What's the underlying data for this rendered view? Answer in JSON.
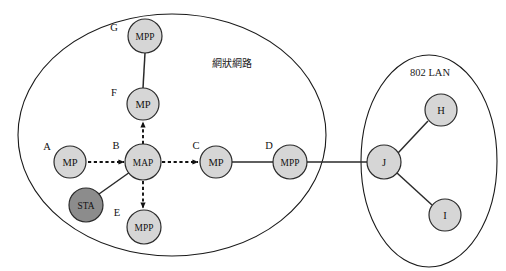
{
  "diagram": {
    "background_color": "#ffffff",
    "regions": [
      {
        "id": "mesh-network",
        "label": "網狀網路",
        "label_x": 232,
        "label_y": 63,
        "cx": 172,
        "cy": 135,
        "rx": 154,
        "ry": 121,
        "stroke": "#1a1a1a"
      },
      {
        "id": "lan-802",
        "label": "802 LAN",
        "label_x": 430,
        "label_y": 72,
        "cx": 429,
        "cy": 161,
        "rx": 68,
        "ry": 106,
        "stroke": "#1a1a1a"
      }
    ],
    "nodes": [
      {
        "id": "G",
        "tag": "G",
        "label": "MPP",
        "x": 145,
        "y": 36,
        "r": 17,
        "fill": "#d6d6d6",
        "tag_x": 114,
        "tag_y": 27,
        "size": "small"
      },
      {
        "id": "F",
        "tag": "F",
        "label": "MP",
        "x": 143,
        "y": 104,
        "r": 16,
        "fill": "#d6d6d6",
        "tag_x": 114,
        "tag_y": 92,
        "size": "normal"
      },
      {
        "id": "A",
        "tag": "A",
        "label": "MP",
        "x": 70,
        "y": 162,
        "r": 16,
        "fill": "#d6d6d6",
        "tag_x": 47,
        "tag_y": 146,
        "size": "normal"
      },
      {
        "id": "B",
        "tag": "B",
        "label": "MAP",
        "x": 143,
        "y": 162,
        "r": 18,
        "fill": "#d6d6d6",
        "tag_x": 116,
        "tag_y": 145,
        "size": "small"
      },
      {
        "id": "STA",
        "tag": "",
        "label": "STA",
        "x": 86,
        "y": 205,
        "r": 17,
        "fill": "#8c8c8c",
        "tag_x": 0,
        "tag_y": 0,
        "size": "small"
      },
      {
        "id": "E",
        "tag": "E",
        "label": "MPP",
        "x": 144,
        "y": 227,
        "r": 17,
        "fill": "#d6d6d6",
        "tag_x": 117,
        "tag_y": 212,
        "size": "small"
      },
      {
        "id": "C",
        "tag": "C",
        "label": "MP",
        "x": 216,
        "y": 162,
        "r": 16,
        "fill": "#d6d6d6",
        "tag_x": 196,
        "tag_y": 145,
        "size": "normal"
      },
      {
        "id": "D",
        "tag": "D",
        "label": "MPP",
        "x": 290,
        "y": 162,
        "r": 17,
        "fill": "#d6d6d6",
        "tag_x": 269,
        "tag_y": 145,
        "size": "small"
      },
      {
        "id": "J",
        "tag": "",
        "label": "J",
        "x": 384,
        "y": 162,
        "r": 17,
        "fill": "#d6d6d6",
        "tag_x": 0,
        "tag_y": 0,
        "size": "normal"
      },
      {
        "id": "H",
        "tag": "",
        "label": "H",
        "x": 441,
        "y": 110,
        "r": 16,
        "fill": "#d6d6d6",
        "tag_x": 0,
        "tag_y": 0,
        "size": "normal"
      },
      {
        "id": "I",
        "tag": "",
        "label": "I",
        "x": 445,
        "y": 215,
        "r": 16,
        "fill": "#d6d6d6",
        "tag_x": 0,
        "tag_y": 0,
        "size": "normal"
      }
    ],
    "links_solid": [
      {
        "from": "G",
        "to": "F",
        "x1": 145,
        "y1": 53,
        "x2": 143,
        "y2": 88
      },
      {
        "from": "STA",
        "to": "B",
        "x1": 99,
        "y1": 194,
        "x2": 130,
        "y2": 172
      },
      {
        "from": "C",
        "to": "D",
        "x1": 232,
        "y1": 162,
        "x2": 273,
        "y2": 162
      },
      {
        "from": "D",
        "to": "J",
        "x1": 307,
        "y1": 162,
        "x2": 367,
        "y2": 162
      },
      {
        "from": "J",
        "to": "H",
        "x1": 398,
        "y1": 153,
        "x2": 428,
        "y2": 121
      },
      {
        "from": "J",
        "to": "I",
        "x1": 397,
        "y1": 173,
        "x2": 432,
        "y2": 205
      }
    ],
    "links_dashed": [
      {
        "from": "A",
        "to": "B",
        "x1": 88,
        "y1": 162,
        "x2": 124,
        "y2": 162,
        "dir": "right"
      },
      {
        "from": "B",
        "to": "F",
        "x1": 143,
        "y1": 144,
        "x2": 143,
        "y2": 122,
        "dir": "up"
      },
      {
        "from": "B",
        "to": "E",
        "x1": 143,
        "y1": 181,
        "x2": 143,
        "y2": 208,
        "dir": "down"
      },
      {
        "from": "B",
        "to": "C",
        "x1": 162,
        "y1": 162,
        "x2": 198,
        "y2": 162,
        "dir": "right"
      }
    ],
    "colors": {
      "node_fill": "#d6d6d6",
      "node_fill_sta": "#8c8c8c",
      "stroke": "#2b2b2b",
      "outline": "#1a1a1a"
    }
  }
}
